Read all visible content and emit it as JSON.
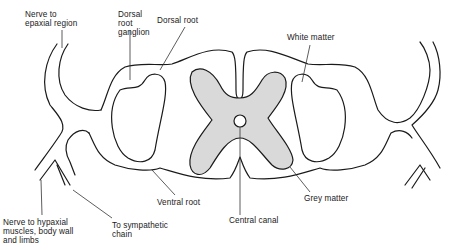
{
  "diagram": {
    "colors": {
      "line": "#1a1a1a",
      "grey_matter_fill": "#d9d9d9",
      "background": "#ffffff"
    },
    "labels": {
      "nerve_to_epaxial": "Nerve to\nepaxial region",
      "dorsal_root_ganglion": "Dorsal\nroot\nganglion",
      "dorsal_root": "Dorsal root",
      "white_matter": "White matter",
      "ventral_root": "Ventral root",
      "grey_matter": "Grey matter",
      "central_canal": "Central canal",
      "nerve_to_hypaxial": "Nerve to hypaxial\nmuscles, body wall\nand limbs",
      "to_sympathetic_chain": "To sympathetic\nchain"
    }
  }
}
